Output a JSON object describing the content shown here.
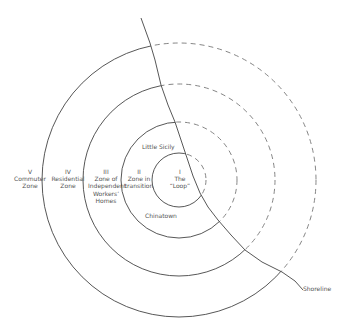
{
  "diagram": {
    "center": [
      179,
      180
    ],
    "stroke_color": "#444444",
    "dashed_color": "#777777",
    "zones": [
      {
        "numeral": "I",
        "name": "The “Loop”",
        "lines": [
          "I",
          "The",
          "“Loop”"
        ],
        "radius": 27
      },
      {
        "numeral": "II",
        "name": "Zone in transition",
        "lines": [
          "II",
          "Zone in",
          "transition"
        ],
        "radius": 58
      },
      {
        "numeral": "III",
        "name": "Zone of Independent Workers' Homes",
        "lines": [
          "III",
          "Zone of",
          "Independent",
          "Workers’",
          "Homes"
        ],
        "radius": 96
      },
      {
        "numeral": "IV",
        "name": "Residential Zone",
        "lines": [
          "IV",
          "Residential",
          "Zone"
        ],
        "radius": 137
      },
      {
        "numeral": "V",
        "name": "Commuter Zone",
        "lines": [
          "V",
          "Commuter",
          "Zone"
        ],
        "radius": null
      }
    ],
    "places": [
      {
        "name": "Little Sicily"
      },
      {
        "name": "Chinatown"
      }
    ],
    "shoreline": {
      "label": "Shoreline"
    }
  }
}
